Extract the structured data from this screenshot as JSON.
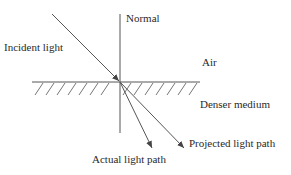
{
  "diagram": {
    "labels": {
      "normal": "Normal",
      "incident": "Incident light",
      "air": "Air",
      "denser": "Denser medium",
      "projected": "Projected light path",
      "actual": "Actual light path"
    },
    "colors": {
      "line": "#555555",
      "text": "#2a2a2a",
      "background": "#ffffff"
    },
    "geometry": {
      "surface_y": 82,
      "surface_x_range": [
        32,
        200
      ],
      "normal_x": 120,
      "normal_y_range": [
        14,
        133
      ],
      "incident_from": [
        52,
        14
      ],
      "incident_to": [
        119,
        81
      ],
      "actual_path_to": [
        152,
        148
      ],
      "projected_path_to": [
        184,
        148
      ]
    }
  }
}
